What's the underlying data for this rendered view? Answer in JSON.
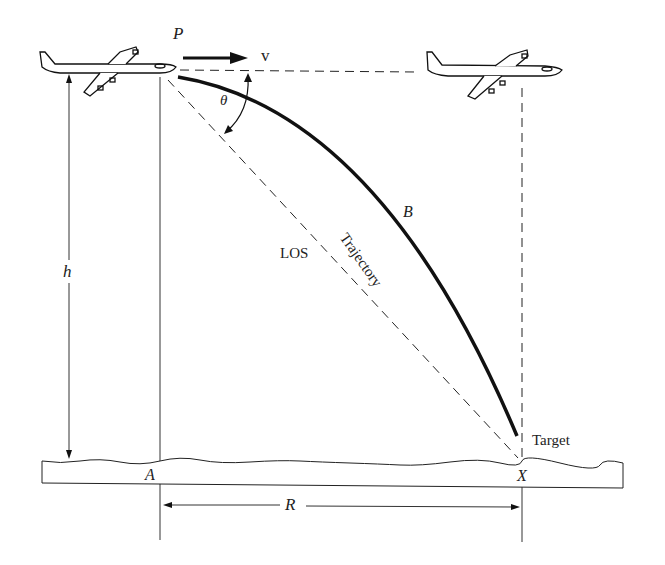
{
  "labels": {
    "P": "P",
    "v": "v",
    "theta": "θ",
    "h": "h",
    "los": "LOS",
    "trajectory": "Trajectory",
    "B": "B",
    "target": "Target",
    "A": "A",
    "X": "X",
    "R": "R"
  },
  "colors": {
    "ink": "#111111",
    "paper": "#ffffff"
  }
}
